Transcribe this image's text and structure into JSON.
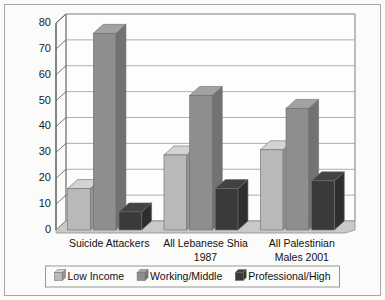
{
  "chart_data": {
    "type": "bar",
    "title": "",
    "subtitle": "",
    "xlabel": "",
    "ylabel": "",
    "ylim": [
      0,
      80
    ],
    "yticks": [
      0,
      10,
      20,
      30,
      40,
      50,
      60,
      70,
      80
    ],
    "grid": true,
    "legend_position": "bottom",
    "style": "3d-grouped-column",
    "categories": [
      "Suicide Attackers",
      "All Lebanese Shia 1987",
      "All Palestinian Males 2001"
    ],
    "category_lines": [
      [
        "Suicide Attackers"
      ],
      [
        "All Lebanese Shia",
        "1987"
      ],
      [
        "All Palestinian",
        "Males 2001"
      ]
    ],
    "series": [
      {
        "name": "Low Income",
        "color": "#b9b9b9",
        "values": [
          16,
          29,
          31
        ]
      },
      {
        "name": "Working/Middle",
        "color": "#8e8e8e",
        "values": [
          76,
          52,
          47
        ]
      },
      {
        "name": "Professional/High",
        "color": "#3a3a3a",
        "values": [
          7,
          16,
          19
        ]
      }
    ]
  },
  "axis": {
    "tick_labels": [
      "0",
      "10",
      "20",
      "30",
      "40",
      "50",
      "60",
      "70",
      "80"
    ]
  },
  "legend": {
    "items": [
      {
        "label": "Low Income",
        "swatch": "legend-swatch-low-income"
      },
      {
        "label": "Working/Middle",
        "swatch": "legend-swatch-working-middle"
      },
      {
        "label": "Professional/High",
        "swatch": "legend-swatch-professional-high"
      }
    ]
  },
  "colors": {
    "background": "#fbfbfa",
    "frame_border": "#a8a8a8",
    "axis_line": "#555555",
    "gridline": "#9a9a9a",
    "floor": "#c9c9c9",
    "series_low_income": "#b9b9b9",
    "series_working_middle": "#8e8e8e",
    "series_professional_high": "#3a3a3a"
  }
}
